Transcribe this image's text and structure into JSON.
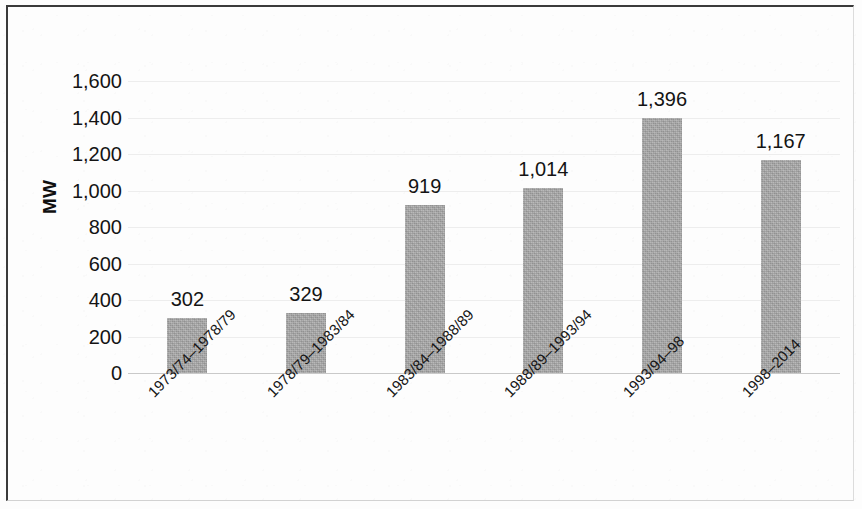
{
  "chart_data": {
    "type": "bar",
    "title": "",
    "subtitle": "",
    "xlabel": "",
    "ylabel": "MW",
    "ylim": [
      0,
      1600
    ],
    "ytick_step": 200,
    "grid": true,
    "legend": "none",
    "bar_color": "#a6a6a6",
    "categories": [
      "1973/74–1978/79",
      "1978/79–1983/84",
      "1983/84–1988/89",
      "1988/89–1993/94",
      "1993/94–98",
      "1998–2014"
    ],
    "values": [
      302,
      329,
      919,
      1014,
      1396,
      1167
    ],
    "value_labels": [
      "302",
      "329",
      "919",
      "1,014",
      "1,396",
      "1,167"
    ],
    "ytick_labels": [
      "1,600",
      "1,400",
      "1,200",
      "1,000",
      "800",
      "600",
      "400",
      "200",
      "0"
    ],
    "ytick_values": [
      1600,
      1400,
      1200,
      1000,
      800,
      600,
      400,
      200,
      0
    ]
  },
  "axis": {
    "y_title": "MW"
  }
}
